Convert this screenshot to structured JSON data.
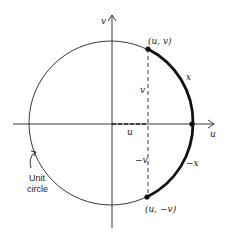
{
  "diagram": {
    "type": "unit-circle",
    "axes": {
      "horizontal_label": "u",
      "vertical_label": "v"
    },
    "points": {
      "upper": "(u, v)",
      "lower": "(u, −v)"
    },
    "segment_labels": {
      "v": "v",
      "neg_v": "−v",
      "u": "u"
    },
    "arc_labels": {
      "upper": "x",
      "lower": "−x"
    },
    "circle_label_line1": "Unit",
    "circle_label_line2": "circle",
    "colors": {
      "ink": "#222222",
      "background": "#ffffff"
    }
  }
}
